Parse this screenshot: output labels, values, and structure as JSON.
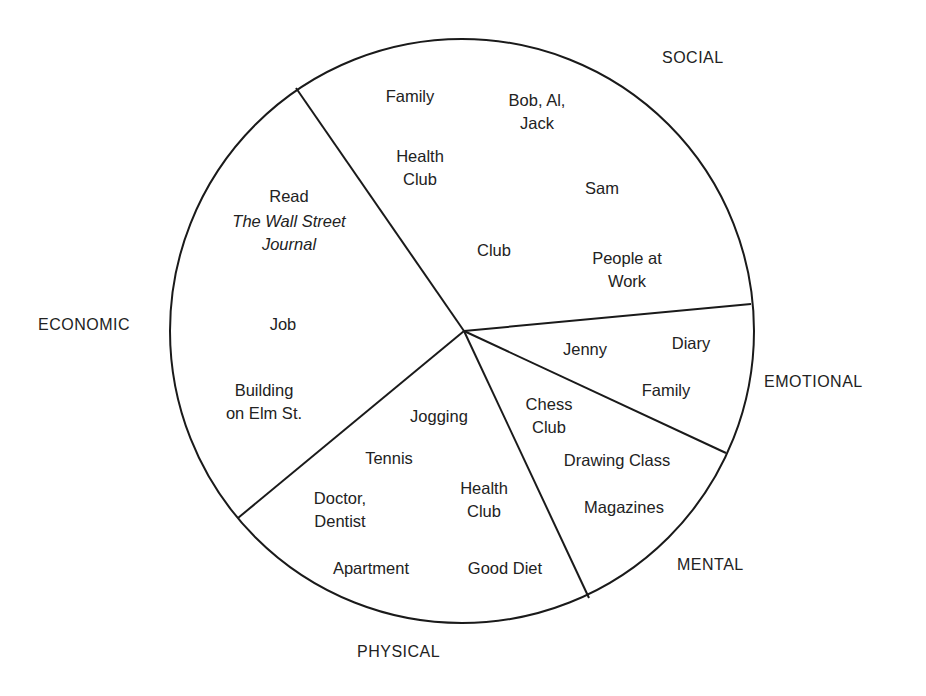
{
  "diagram": {
    "type": "sectored-circle",
    "title": "",
    "circle": {
      "cx": 462,
      "cy": 331,
      "r": 292,
      "stroke": "#1a1a1a"
    },
    "hub": {
      "x": 464,
      "y": 331
    },
    "dividers": [
      {
        "name": "social-economic-divider",
        "x": 296,
        "y": 88
      },
      {
        "name": "social-emotional-divider",
        "x": 751,
        "y": 304
      },
      {
        "name": "emotional-mental-divider",
        "x": 726,
        "y": 453
      },
      {
        "name": "mental-physical-divider",
        "x": 589,
        "y": 598
      },
      {
        "name": "physical-economic-divider",
        "x": 238,
        "y": 518
      }
    ],
    "categories": [
      {
        "id": "social",
        "label": "SOCIAL",
        "x": 662,
        "y": 63
      },
      {
        "id": "economic",
        "label": "ECONOMIC",
        "x": 38,
        "y": 330
      },
      {
        "id": "emotional",
        "label": "EMOTIONAL",
        "x": 764,
        "y": 387
      },
      {
        "id": "mental",
        "label": "MENTAL",
        "x": 677,
        "y": 570
      },
      {
        "id": "physical",
        "label": "PHYSICAL",
        "x": 357,
        "y": 657
      }
    ],
    "sectors": {
      "social": [
        {
          "lines": [
            "Family"
          ],
          "x": 410,
          "y": 102,
          "italic": false
        },
        {
          "lines": [
            "Bob, Al,",
            "Jack"
          ],
          "x": 537,
          "y": 106,
          "italic": false
        },
        {
          "lines": [
            "Health",
            "Club"
          ],
          "x": 420,
          "y": 162,
          "italic": false
        },
        {
          "lines": [
            "Sam"
          ],
          "x": 602,
          "y": 194,
          "italic": false
        },
        {
          "lines": [
            "Club"
          ],
          "x": 494,
          "y": 256,
          "italic": false
        },
        {
          "lines": [
            "People at",
            "Work"
          ],
          "x": 627,
          "y": 264,
          "italic": false
        }
      ],
      "economic": [
        {
          "lines": [
            "Read"
          ],
          "x": 289,
          "y": 202,
          "italic": false
        },
        {
          "lines": [
            "The Wall Street",
            "Journal"
          ],
          "x": 289,
          "y": 227,
          "italic": true
        },
        {
          "lines": [
            "Job"
          ],
          "x": 283,
          "y": 330,
          "italic": false
        },
        {
          "lines": [
            "Building",
            "on Elm St."
          ],
          "x": 264,
          "y": 396,
          "italic": false
        }
      ],
      "emotional": [
        {
          "lines": [
            "Jenny"
          ],
          "x": 585,
          "y": 355,
          "italic": false
        },
        {
          "lines": [
            "Diary"
          ],
          "x": 691,
          "y": 349,
          "italic": false
        },
        {
          "lines": [
            "Family"
          ],
          "x": 666,
          "y": 396,
          "italic": false
        }
      ],
      "mental": [
        {
          "lines": [
            "Chess",
            "Club"
          ],
          "x": 549,
          "y": 410,
          "italic": false
        },
        {
          "lines": [
            "Drawing Class"
          ],
          "x": 617,
          "y": 466,
          "italic": false
        },
        {
          "lines": [
            "Magazines"
          ],
          "x": 624,
          "y": 513,
          "italic": false
        }
      ],
      "physical": [
        {
          "lines": [
            "Jogging"
          ],
          "x": 439,
          "y": 422,
          "italic": false
        },
        {
          "lines": [
            "Tennis"
          ],
          "x": 389,
          "y": 464,
          "italic": false
        },
        {
          "lines": [
            "Doctor,",
            "Dentist"
          ],
          "x": 340,
          "y": 504,
          "italic": false
        },
        {
          "lines": [
            "Health",
            "Club"
          ],
          "x": 484,
          "y": 494,
          "italic": false
        },
        {
          "lines": [
            "Apartment"
          ],
          "x": 371,
          "y": 574,
          "italic": false
        },
        {
          "lines": [
            "Good Diet"
          ],
          "x": 505,
          "y": 574,
          "italic": false
        }
      ]
    }
  }
}
